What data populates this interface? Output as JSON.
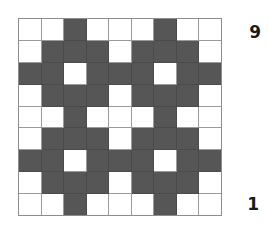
{
  "figure": {
    "title": "",
    "background_color": "#ffffff"
  },
  "grid": {
    "rows": 9,
    "columns": 9,
    "filled_color": "#565656",
    "empty_color": "#ffffff",
    "line_color": "#9a9a9a",
    "legend": {
      "filled": "filled-cell",
      "empty": "empty-cell"
    },
    "cells": [
      [
        0,
        0,
        1,
        0,
        0,
        0,
        1,
        0,
        0
      ],
      [
        0,
        1,
        1,
        1,
        0,
        1,
        1,
        1,
        0
      ],
      [
        1,
        1,
        0,
        1,
        1,
        1,
        0,
        1,
        1
      ],
      [
        0,
        1,
        1,
        1,
        0,
        1,
        1,
        1,
        0
      ],
      [
        0,
        0,
        1,
        0,
        0,
        0,
        1,
        0,
        0
      ],
      [
        0,
        1,
        1,
        1,
        0,
        1,
        1,
        1,
        0
      ],
      [
        1,
        1,
        0,
        1,
        1,
        1,
        0,
        1,
        1
      ],
      [
        0,
        1,
        1,
        1,
        0,
        1,
        1,
        1,
        0
      ],
      [
        0,
        0,
        1,
        0,
        0,
        0,
        1,
        0,
        0
      ]
    ]
  },
  "axis": {
    "top_label": "9",
    "bottom_label": "1"
  },
  "chart_data": {
    "type": "heatmap",
    "title": "",
    "xlabel": "",
    "ylabel": "",
    "categories_x": [
      "1",
      "2",
      "3",
      "4",
      "5",
      "6",
      "7",
      "8",
      "9"
    ],
    "categories_y": [
      "9",
      "8",
      "7",
      "6",
      "5",
      "4",
      "3",
      "2",
      "1"
    ],
    "ytick_labels_shown": [
      "9",
      "1"
    ],
    "grid": true,
    "legend_position": "none",
    "value_labels": {
      "0": "empty",
      "1": "filled"
    },
    "colors": {
      "0": "#ffffff",
      "1": "#565656"
    },
    "values": [
      [
        0,
        0,
        1,
        0,
        0,
        0,
        1,
        0,
        0
      ],
      [
        0,
        1,
        1,
        1,
        0,
        1,
        1,
        1,
        0
      ],
      [
        1,
        1,
        0,
        1,
        1,
        1,
        0,
        1,
        1
      ],
      [
        0,
        1,
        1,
        1,
        0,
        1,
        1,
        1,
        0
      ],
      [
        0,
        0,
        1,
        0,
        0,
        0,
        1,
        0,
        0
      ],
      [
        0,
        1,
        1,
        1,
        0,
        1,
        1,
        1,
        0
      ],
      [
        1,
        1,
        0,
        1,
        1,
        1,
        0,
        1,
        1
      ],
      [
        0,
        1,
        1,
        1,
        0,
        1,
        1,
        1,
        0
      ],
      [
        0,
        0,
        1,
        0,
        0,
        0,
        1,
        0,
        0
      ]
    ]
  }
}
